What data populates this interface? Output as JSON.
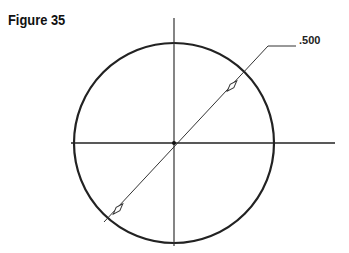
{
  "figure": {
    "title": "Figure 35",
    "dimension_label": ".500"
  },
  "drawing": {
    "circle": {
      "cx": 174,
      "cy": 143,
      "r": 100,
      "stroke": "#222222"
    },
    "centerlines": {
      "horizontal": {
        "x1": 71,
        "x2": 335,
        "y": 143
      },
      "vertical": {
        "x": 174,
        "y1": 16,
        "y2": 247
      }
    },
    "diameter_leader": {
      "from": [
        118,
        209
      ],
      "to": [
        268,
        46
      ],
      "shoulder_end": [
        296,
        46
      ]
    }
  }
}
